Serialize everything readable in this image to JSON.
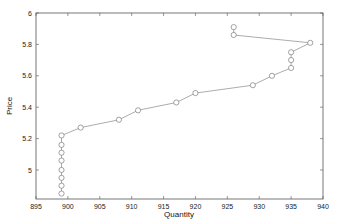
{
  "chart_data": {
    "type": "line",
    "title": "",
    "xlabel": "Quantity",
    "ylabel": "Price",
    "xlim": [
      895,
      940
    ],
    "ylim": [
      4.82,
      6.0
    ],
    "xticks": [
      895,
      900,
      905,
      910,
      915,
      920,
      925,
      930,
      935,
      940
    ],
    "yticks": [
      5,
      5.2,
      5.4,
      5.6,
      5.8,
      6
    ],
    "ytick_labels": [
      "5",
      "5.2",
      "5.4",
      "5.6",
      "5.8",
      "6"
    ],
    "grid": false,
    "legend": null,
    "marker": "circle-open",
    "line_color": "#888888",
    "series": [
      {
        "name": "price-quantity",
        "x": [
          926,
          926,
          938,
          935,
          935,
          935,
          932,
          929,
          920,
          917,
          911,
          908,
          902,
          899,
          899,
          899,
          899,
          899,
          899,
          899,
          899
        ],
        "y": [
          5.91,
          5.86,
          5.81,
          5.75,
          5.7,
          5.65,
          5.6,
          5.54,
          5.49,
          5.43,
          5.38,
          5.32,
          5.27,
          5.22,
          5.16,
          5.11,
          5.06,
          5.0,
          4.95,
          4.9,
          4.85
        ]
      }
    ]
  }
}
